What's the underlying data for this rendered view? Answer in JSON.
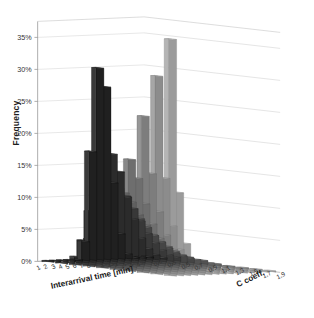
{
  "chart_data": {
    "type": "bar",
    "subtype": "3d-bar",
    "title": "",
    "xlabel": "Interarrival time [min]",
    "ylabel": "Frequency",
    "zlabel": "C coeff.",
    "grid": true,
    "legend": "none",
    "ylim": [
      0,
      0.375
    ],
    "ytick_labels": [
      "0%",
      "5%",
      "10%",
      "15%",
      "20%",
      "25%",
      "30%",
      "35%"
    ],
    "ytick_values": [
      0,
      0.05,
      0.1,
      0.15,
      0.2,
      0.25,
      0.3,
      0.35
    ],
    "categories": [
      "1",
      "2",
      "3",
      "4",
      "5",
      "6",
      "7",
      "8",
      "9",
      "10",
      "11",
      "12",
      "13",
      "14",
      "15"
    ],
    "series": [
      {
        "name": "0,1",
        "values": [
          0.0,
          0.0,
          0.0,
          0.0,
          0.002,
          0.03,
          0.17,
          0.3,
          0.27,
          0.12,
          0.04,
          0.008,
          0.002,
          0.0,
          0.0
        ]
      },
      {
        "name": "0,3",
        "values": [
          0.0,
          0.002,
          0.01,
          0.035,
          0.08,
          0.135,
          0.17,
          0.168,
          0.14,
          0.1,
          0.065,
          0.035,
          0.018,
          0.008,
          0.003
        ]
      },
      {
        "name": "0,5",
        "values": [
          0.002,
          0.012,
          0.04,
          0.075,
          0.105,
          0.12,
          0.118,
          0.105,
          0.085,
          0.065,
          0.045,
          0.03,
          0.018,
          0.01,
          0.006
        ]
      },
      {
        "name": "0,7",
        "values": [
          0.01,
          0.04,
          0.075,
          0.095,
          0.1,
          0.095,
          0.085,
          0.072,
          0.058,
          0.045,
          0.034,
          0.024,
          0.016,
          0.011,
          0.007
        ]
      },
      {
        "name": "0,9",
        "values": [
          0.04,
          0.085,
          0.098,
          0.095,
          0.085,
          0.072,
          0.06,
          0.048,
          0.038,
          0.03,
          0.022,
          0.016,
          0.012,
          0.008,
          0.006
        ]
      },
      {
        "name": "1,1",
        "values": [
          0.105,
          0.12,
          0.105,
          0.085,
          0.068,
          0.053,
          0.04,
          0.03,
          0.023,
          0.017,
          0.013,
          0.009,
          0.007,
          0.005,
          0.003
        ]
      },
      {
        "name": "1,3",
        "values": [
          0.175,
          0.145,
          0.105,
          0.073,
          0.05,
          0.035,
          0.024,
          0.016,
          0.011,
          0.008,
          0.005,
          0.004,
          0.002,
          0.002,
          0.001
        ]
      },
      {
        "name": "1,5",
        "values": [
          0.245,
          0.155,
          0.095,
          0.058,
          0.035,
          0.021,
          0.013,
          0.008,
          0.005,
          0.003,
          0.002,
          0.001,
          0.001,
          0.0,
          0.0
        ]
      },
      {
        "name": "1,7",
        "values": [
          0.31,
          0.15,
          0.075,
          0.038,
          0.019,
          0.01,
          0.005,
          0.003,
          0.001,
          0.001,
          0.0,
          0.0,
          0.0,
          0.0,
          0.0
        ]
      },
      {
        "name": "1,9",
        "values": [
          0.37,
          0.13,
          0.05,
          0.02,
          0.008,
          0.003,
          0.001,
          0.001,
          0.0,
          0.0,
          0.0,
          0.0,
          0.0,
          0.0,
          0.0
        ]
      }
    ],
    "series_colors": [
      "#3a3a3a",
      "#454545",
      "#525252",
      "#5f5f5f",
      "#6c6c6c",
      "#7a7a7a",
      "#888888",
      "#979797",
      "#a6a6a6",
      "#b5b5b5"
    ],
    "wall_color": "#d9d9d9",
    "floor_color": "#ffffff",
    "gridline_color": "#d0d0d0"
  }
}
